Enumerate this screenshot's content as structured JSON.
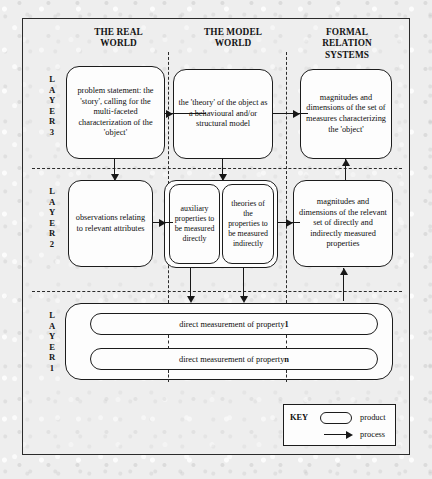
{
  "figure": {
    "columns": [
      {
        "id": "real-world",
        "title": "THE REAL\nWORLD"
      },
      {
        "id": "model-world",
        "title": "THE MODEL\nWORLD"
      },
      {
        "id": "formal-relation-systems",
        "title": "FORMAL\nRELATION\nSYSTEMS"
      }
    ],
    "column_titles": {
      "real_world": "THE REAL WORLD",
      "model_world": "THE MODEL WORLD",
      "formal_relation_systems": "FORMAL RELATION SYSTEMS"
    },
    "layers": [
      {
        "id": "layer-3",
        "label": "LAYER 3",
        "letters": [
          "L",
          "A",
          "Y",
          "E",
          "R",
          "3"
        ]
      },
      {
        "id": "layer-2",
        "label": "LAYER 2",
        "letters": [
          "L",
          "A",
          "Y",
          "E",
          "R",
          "2"
        ]
      },
      {
        "id": "layer-1",
        "label": "LAYER 1",
        "letters": [
          "L",
          "A",
          "Y",
          "E",
          "R",
          "1"
        ]
      }
    ],
    "nodes": {
      "l3_real": "problem statement: the 'story', calling for the multi-faceted characterization of the 'object'",
      "l3_model": "the 'theory' of the object as a behavioural and/or structural model",
      "l3_formal": "magnitudes and dimensions of the set of measures characterizing the 'object'",
      "l2_real": "observations relating to relevant attributes",
      "l2_model_a": "auxiliary properties to be measured directly",
      "l2_model_b": "theories of the properties to be measured indirectly",
      "l2_formal": "magnitudes and dimensions of the relevant set of directly and indirectly measured properties",
      "l1_row1_prefix": "direct measurement of property ",
      "l1_row1_index": "1",
      "l1_row2_prefix": "direct measurement of property ",
      "l1_row2_index": "n"
    },
    "key": {
      "title": "KEY",
      "product_label": "product",
      "process_label": "process"
    },
    "colors": {
      "background": "#eeeeee",
      "stroke": "#1c1c1c",
      "node_fill": "#fdfdfd",
      "text": "#0d0d0d"
    }
  }
}
